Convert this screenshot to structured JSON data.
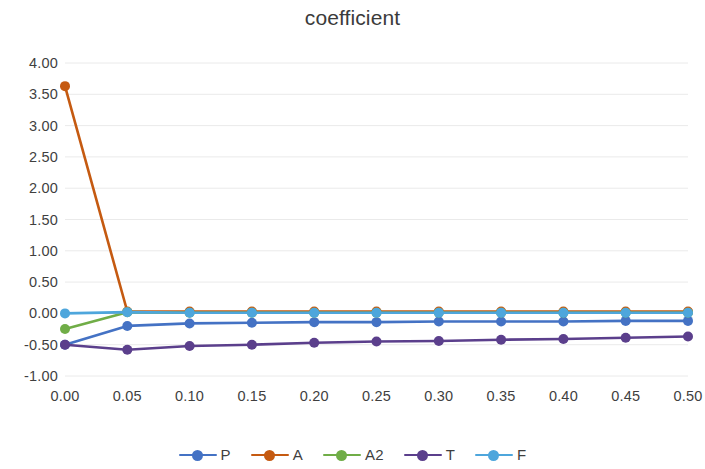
{
  "chart_data": {
    "type": "line",
    "title": "coefficient",
    "xlabel": "",
    "ylabel": "",
    "x": [
      0.0,
      0.05,
      0.1,
      0.15,
      0.2,
      0.25,
      0.3,
      0.35,
      0.4,
      0.45,
      0.5
    ],
    "xtick_labels": [
      "0.00",
      "0.05",
      "0.10",
      "0.15",
      "0.20",
      "0.25",
      "0.30",
      "0.35",
      "0.40",
      "0.45",
      "0.50"
    ],
    "ytick_labels": [
      "4.00",
      "3.50",
      "3.00",
      "2.50",
      "2.00",
      "1.50",
      "1.00",
      "0.50",
      "0.00",
      "-0.50",
      "-1.00"
    ],
    "ytick_values": [
      4.0,
      3.5,
      3.0,
      2.5,
      2.0,
      1.5,
      1.0,
      0.5,
      0.0,
      -0.5,
      -1.0
    ],
    "xlim": [
      0.0,
      0.5
    ],
    "ylim": [
      -1.0,
      4.0
    ],
    "grid": true,
    "grid_axis": "y",
    "legend_position": "bottom",
    "marker": "circle",
    "series": [
      {
        "name": "P",
        "color": "#4472C4",
        "values": [
          -0.5,
          -0.2,
          -0.16,
          -0.15,
          -0.14,
          -0.14,
          -0.13,
          -0.13,
          -0.13,
          -0.12,
          -0.12
        ]
      },
      {
        "name": "A",
        "color": "#C55A11",
        "values": [
          3.63,
          0.03,
          0.03,
          0.03,
          0.03,
          0.03,
          0.03,
          0.03,
          0.03,
          0.03,
          0.03
        ]
      },
      {
        "name": "A2",
        "color": "#70AD47",
        "values": [
          -0.25,
          0.02,
          0.01,
          0.01,
          0.01,
          0.01,
          0.01,
          0.01,
          0.01,
          0.01,
          0.01
        ]
      },
      {
        "name": "T",
        "color": "#5B3F8C",
        "values": [
          -0.5,
          -0.58,
          -0.52,
          -0.5,
          -0.47,
          -0.45,
          -0.44,
          -0.42,
          -0.41,
          -0.39,
          -0.37
        ]
      },
      {
        "name": "F",
        "color": "#4EA6DC",
        "values": [
          0.0,
          0.02,
          0.01,
          0.01,
          0.01,
          0.01,
          0.01,
          0.01,
          0.01,
          0.01,
          0.01
        ]
      }
    ]
  },
  "legend": {
    "items": [
      {
        "label": "P"
      },
      {
        "label": "A"
      },
      {
        "label": "A2"
      },
      {
        "label": "T"
      },
      {
        "label": "F"
      }
    ]
  },
  "colors": {
    "grid": "#e8e8e8",
    "axis_text": "#3f3f3f",
    "title_text": "#3b3b3b",
    "background": "#ffffff"
  }
}
